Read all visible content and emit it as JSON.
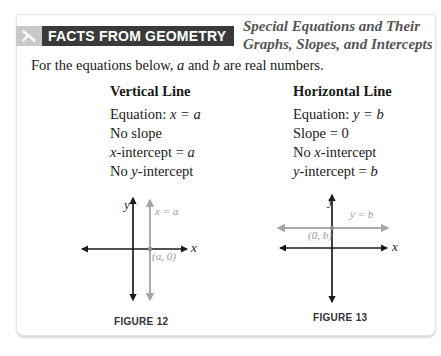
{
  "header": {
    "banner_label": "FACTS FROM GEOMETRY",
    "banner_icon": "ruler-compass-icon",
    "subtitle_line1": "Special Equations and Their",
    "subtitle_line2": "Graphs, Slopes, and Intercepts"
  },
  "intro": {
    "prefix": "For the equations below, ",
    "var_a": "a",
    "mid": " and ",
    "var_b": "b",
    "suffix": " are real numbers."
  },
  "vertical": {
    "title": "Vertical Line",
    "equation_label": "Equation: ",
    "equation": "x = a",
    "slope": "No slope",
    "x_intercept_var": "x",
    "x_intercept_rest": "-intercept = ",
    "x_intercept_val": "a",
    "y_intercept_prefix": "No ",
    "y_intercept_var": "y",
    "y_intercept_rest": "-intercept",
    "figure": {
      "caption": "FIGURE 12",
      "x_axis_label": "x",
      "y_axis_label": "y",
      "line_label": "x = a",
      "point_label": "(a, 0)"
    }
  },
  "horizontal": {
    "title": "Horizontal Line",
    "equation_label": "Equation: ",
    "equation": "y = b",
    "slope": "Slope = 0",
    "x_intercept_prefix": "No ",
    "x_intercept_var": "x",
    "x_intercept_rest": "-intercept",
    "y_intercept_var": "y",
    "y_intercept_rest": "-intercept = ",
    "y_intercept_val": "b",
    "figure": {
      "caption": "FIGURE 13",
      "x_axis_label": "x",
      "y_axis_label": "y",
      "line_label": "y = b",
      "point_label": "(0, b)"
    }
  },
  "colors": {
    "banner_bg": "#3a3a3a",
    "banner_icon_bg": "#c9c9c9",
    "axis": "#1a1a1a",
    "highlight_line": "#a6a6a6",
    "highlight_text": "#9a9a9a"
  }
}
